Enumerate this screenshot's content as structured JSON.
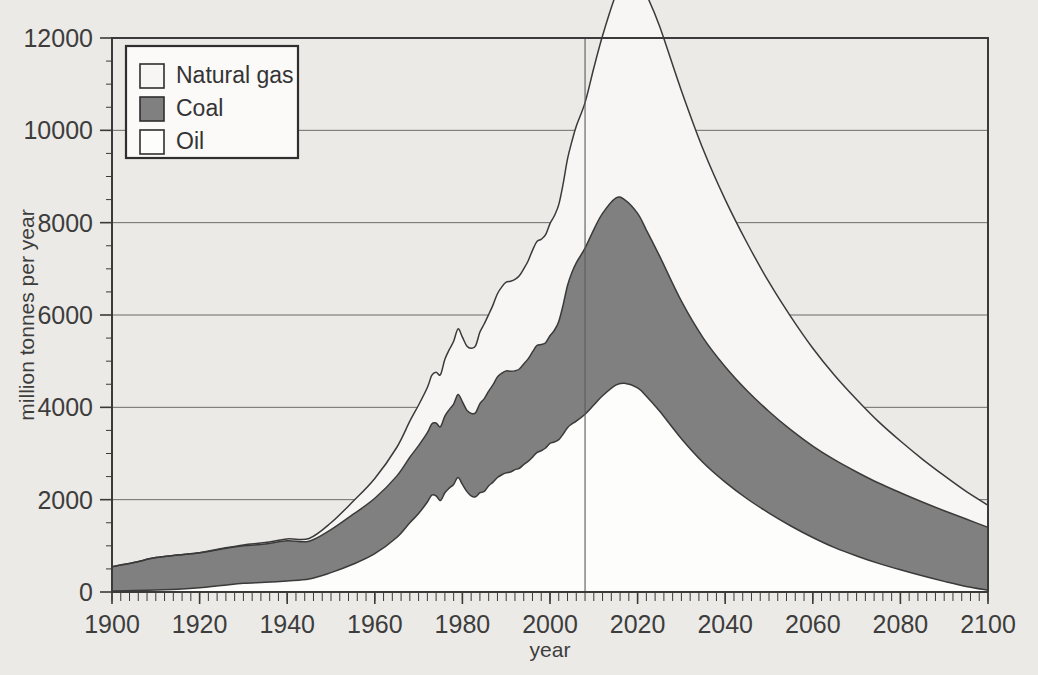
{
  "chart_data": {
    "type": "area",
    "title": "",
    "subtitle": "",
    "xlabel": "year",
    "ylabel": "million tonnes per year",
    "xlim": [
      1900,
      2100
    ],
    "ylim": [
      0,
      12000
    ],
    "grid": true,
    "stacked": true,
    "stack_order_bottom_to_top": [
      "Oil",
      "Coal",
      "Natural gas"
    ],
    "x_ticks": [
      1900,
      1920,
      1940,
      1960,
      1980,
      2000,
      2020,
      2040,
      2060,
      2080,
      2100
    ],
    "x_tick_labels": [
      "1900",
      "1920",
      "1940",
      "1960",
      "1980",
      "2000",
      "2020",
      "2040",
      "2060",
      "2080",
      "2100"
    ],
    "x_minor_tick_interval": 2,
    "y_ticks": [
      0,
      2000,
      4000,
      6000,
      8000,
      10000,
      12000
    ],
    "y_tick_labels": [
      "0",
      "2000",
      "4000",
      "6000",
      "8000",
      "10000",
      "12000"
    ],
    "legend_position": "top-left",
    "legend_entries": [
      {
        "name": "Natural gas",
        "color": "#f7f6f4"
      },
      {
        "name": "Coal",
        "color": "#808080"
      },
      {
        "name": "Oil",
        "color": "#fdfdfc"
      }
    ],
    "annotations": [
      {
        "type": "vline",
        "x": 2008,
        "label": "present day"
      }
    ],
    "x": [
      1900,
      1905,
      1910,
      1915,
      1920,
      1925,
      1930,
      1935,
      1940,
      1945,
      1950,
      1955,
      1960,
      1965,
      1968,
      1970,
      1972,
      1973,
      1974,
      1975,
      1976,
      1977,
      1978,
      1979,
      1980,
      1981,
      1982,
      1983,
      1984,
      1985,
      1986,
      1987,
      1988,
      1989,
      1990,
      1991,
      1992,
      1993,
      1994,
      1995,
      1996,
      1997,
      1998,
      1999,
      2000,
      2001,
      2002,
      2003,
      2004,
      2005,
      2006,
      2008,
      2010,
      2012,
      2015,
      2017,
      2020,
      2022,
      2025,
      2030,
      2035,
      2040,
      2045,
      2050,
      2055,
      2060,
      2065,
      2070,
      2075,
      2080,
      2085,
      2090,
      2095,
      2100
    ],
    "series": [
      {
        "name": "Oil",
        "values": [
          20,
          30,
          45,
          60,
          90,
          140,
          190,
          210,
          240,
          280,
          420,
          600,
          830,
          1180,
          1500,
          1700,
          1950,
          2100,
          2080,
          1980,
          2150,
          2250,
          2330,
          2480,
          2330,
          2180,
          2080,
          2060,
          2150,
          2180,
          2300,
          2380,
          2480,
          2540,
          2580,
          2600,
          2650,
          2680,
          2760,
          2830,
          2920,
          3020,
          3060,
          3120,
          3220,
          3250,
          3300,
          3420,
          3560,
          3640,
          3700,
          3850,
          4050,
          4250,
          4480,
          4520,
          4420,
          4240,
          3920,
          3320,
          2800,
          2380,
          2020,
          1710,
          1430,
          1180,
          960,
          780,
          620,
          480,
          350,
          230,
          120,
          40
        ]
      },
      {
        "name": "Coal",
        "values": [
          530,
          610,
          700,
          740,
          760,
          790,
          810,
          830,
          870,
          820,
          930,
          1080,
          1200,
          1330,
          1420,
          1470,
          1500,
          1540,
          1580,
          1600,
          1660,
          1700,
          1740,
          1800,
          1790,
          1760,
          1790,
          1820,
          1930,
          2010,
          2050,
          2110,
          2180,
          2200,
          2210,
          2180,
          2140,
          2150,
          2180,
          2220,
          2280,
          2320,
          2300,
          2280,
          2330,
          2420,
          2560,
          2800,
          3080,
          3280,
          3430,
          3600,
          3800,
          3950,
          4050,
          3980,
          3780,
          3600,
          3360,
          2980,
          2700,
          2500,
          2340,
          2200,
          2080,
          1980,
          1900,
          1820,
          1740,
          1670,
          1600,
          1530,
          1460,
          1360
        ]
      },
      {
        "name": "Natural gas",
        "values": [
          0,
          0,
          0,
          0,
          0,
          10,
          20,
          30,
          40,
          60,
          150,
          280,
          430,
          620,
          780,
          880,
          980,
          1050,
          1100,
          1130,
          1230,
          1300,
          1360,
          1420,
          1400,
          1390,
          1410,
          1450,
          1550,
          1620,
          1660,
          1730,
          1800,
          1870,
          1920,
          1950,
          1980,
          2020,
          2060,
          2120,
          2200,
          2250,
          2280,
          2340,
          2430,
          2480,
          2530,
          2620,
          2740,
          2840,
          2960,
          3150,
          3500,
          3850,
          4400,
          4780,
          5080,
          5100,
          4980,
          4560,
          4080,
          3620,
          3200,
          2800,
          2450,
          2120,
          1830,
          1570,
          1330,
          1120,
          930,
          760,
          600,
          480
        ]
      }
    ],
    "totals_note": {
      "peak_total": 11300,
      "peak_total_year": 2020,
      "value_1900": 550,
      "value_2100": 1880
    }
  },
  "figure": {
    "background_color": "#eceae6",
    "plot_border_color": "#3a3a3a",
    "gridline_color": "#6b6b6b"
  }
}
